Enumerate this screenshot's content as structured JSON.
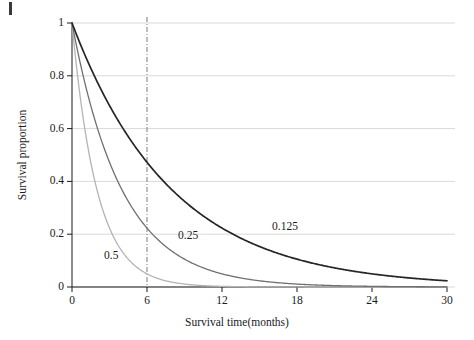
{
  "chart_data": {
    "type": "line",
    "title": "",
    "xlabel": "Survival time(months)",
    "ylabel": "Survival proportion",
    "xlim": [
      0,
      30
    ],
    "ylim": [
      0,
      1
    ],
    "xticks": [
      "0",
      "6",
      "12",
      "18",
      "24",
      "30"
    ],
    "xtick_values": [
      0,
      6,
      12,
      18,
      24,
      30
    ],
    "yticks": [
      "0",
      "0.2",
      "0.4",
      "0.6",
      "0.8",
      "1"
    ],
    "ytick_values": [
      0,
      0.2,
      0.4,
      0.6,
      0.8,
      1
    ],
    "grid": "horizontal",
    "legend": "inline-curve-labels",
    "annotations": [
      {
        "text": "0.5",
        "x_px": 104,
        "y_px": 256,
        "series": "hazard-0.5"
      },
      {
        "text": "0.25",
        "x_px": 178,
        "y_px": 236,
        "series": "hazard-0.25"
      },
      {
        "text": "0.125",
        "x_px": 272,
        "y_px": 227,
        "series": "hazard-0.125"
      }
    ],
    "reference_lines": [
      {
        "orientation": "vertical",
        "value": 6,
        "style": "dash-dot",
        "color": "#888888"
      }
    ],
    "model": "S(t) = exp(-lambda * t)",
    "series": [
      {
        "name": "0.5",
        "lambda": 0.5,
        "color": "#b4b4b4",
        "x": [
          0,
          1,
          2,
          3,
          4,
          5,
          6,
          7,
          8,
          9,
          10,
          12,
          14,
          16,
          18,
          20,
          22,
          24,
          26,
          28,
          30
        ],
        "values": [
          1.0,
          0.607,
          0.368,
          0.223,
          0.135,
          0.082,
          0.05,
          0.03,
          0.018,
          0.011,
          0.007,
          0.002,
          0.001,
          0.0,
          0.0,
          0.0,
          0.0,
          0.0,
          0.0,
          0.0,
          0.0
        ]
      },
      {
        "name": "0.25",
        "lambda": 0.25,
        "color": "#707070",
        "x": [
          0,
          1,
          2,
          3,
          4,
          5,
          6,
          7,
          8,
          9,
          10,
          12,
          14,
          16,
          18,
          20,
          22,
          24,
          26,
          28,
          30
        ],
        "values": [
          1.0,
          0.779,
          0.607,
          0.472,
          0.368,
          0.287,
          0.223,
          0.174,
          0.135,
          0.105,
          0.082,
          0.05,
          0.03,
          0.018,
          0.011,
          0.007,
          0.004,
          0.002,
          0.002,
          0.001,
          0.001
        ]
      },
      {
        "name": "0.125",
        "lambda": 0.125,
        "color": "#262626",
        "x": [
          0,
          1,
          2,
          3,
          4,
          5,
          6,
          7,
          8,
          9,
          10,
          12,
          14,
          16,
          18,
          20,
          22,
          24,
          26,
          28,
          30
        ],
        "values": [
          1.0,
          0.882,
          0.779,
          0.687,
          0.607,
          0.535,
          0.472,
          0.417,
          0.368,
          0.325,
          0.287,
          0.223,
          0.174,
          0.135,
          0.105,
          0.082,
          0.064,
          0.05,
          0.039,
          0.03,
          0.024
        ]
      }
    ]
  },
  "colors": {
    "axis": "#1a1a1a",
    "grid": "#d9d9d9",
    "reference_line": "#8c8c8c",
    "background": "#ffffff"
  }
}
